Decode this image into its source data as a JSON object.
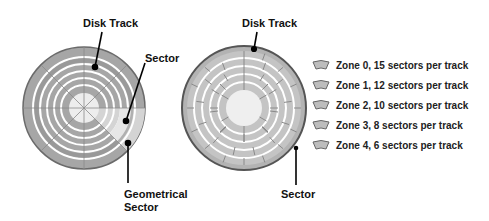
{
  "diagram": {
    "left_disk": {
      "labels": {
        "disk_track": "Disk Track",
        "sector": "Sector",
        "geometrical_sector_line1": "Geometrical",
        "geometrical_sector_line2": "Sector"
      }
    },
    "right_disk": {
      "labels": {
        "disk_track": "Disk Track",
        "sector": "Sector"
      }
    },
    "legend": [
      {
        "label": "Zone 0, 15 sectors per track"
      },
      {
        "label": "Zone 1, 12 sectors per track"
      },
      {
        "label": "Zone 2, 10 sectors per track"
      },
      {
        "label": "Zone 3, 8 sectors per track"
      },
      {
        "label": "Zone 4, 6 sectors per track"
      }
    ],
    "colors": {
      "disk_fill": "#a9a9a9",
      "disk_edge": "#6e6e6e",
      "track_line": "#ffffff",
      "highlight": "#d9d9d9",
      "hub": "#efefef"
    }
  }
}
